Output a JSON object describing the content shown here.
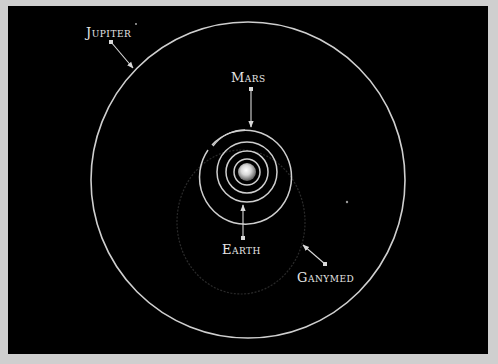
{
  "diagram": {
    "colors": {
      "background": "#000000",
      "frame": "#cfcfcf",
      "orbit": "#cfcfcf",
      "faint_orbit": "#2a2a2a",
      "label": "#e6e6e6",
      "sun_core": "#ffffff",
      "sun_edge": "#6a6a6a"
    },
    "labels": {
      "jupiter": "Jupiter",
      "mars": "Mars",
      "earth": "Earth",
      "ganymed": "Ganymed"
    },
    "bodies": {
      "sun": {
        "cx": 247,
        "cy": 172,
        "r": 9
      },
      "star": {
        "cx": 347,
        "cy": 202,
        "r": 1.2
      }
    },
    "orbits": {
      "jupiter": {
        "cx": 248,
        "cy": 180,
        "rx": 157,
        "ry": 158
      },
      "inner_rings": [
        {
          "cx": 247,
          "cy": 172,
          "r": 13
        },
        {
          "cx": 247,
          "cy": 172,
          "r": 21
        },
        {
          "cx": 247,
          "cy": 172,
          "r": 30
        },
        {
          "cx": 247,
          "cy": 176,
          "r": 46
        }
      ],
      "ganymed": {
        "cx": 241,
        "cy": 222,
        "rx": 64,
        "ry": 72
      }
    },
    "pointers": {
      "jupiter": {
        "x1": 111,
        "y1": 42,
        "x2": 133,
        "y2": 68
      },
      "mars": {
        "x1": 251,
        "y1": 89,
        "x2": 251,
        "y2": 128
      },
      "earth": {
        "x1": 243,
        "y1": 238,
        "x2": 243,
        "y2": 205
      },
      "ganymed": {
        "x1": 325,
        "y1": 264,
        "x2": 303,
        "y2": 245
      }
    }
  }
}
